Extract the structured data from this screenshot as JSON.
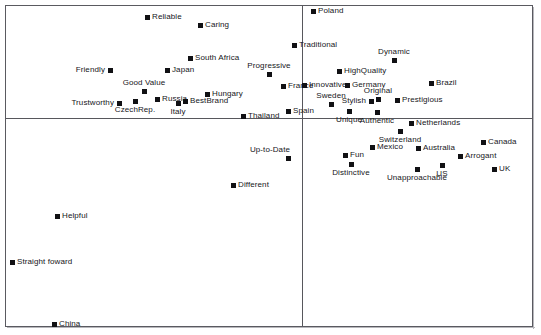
{
  "figure": {
    "type": "perceptual-map",
    "background": "#ffffff",
    "frame_color": "#5a5a60",
    "marker_color": "#111114",
    "label_color": "#16161a",
    "width": 541,
    "height": 335
  },
  "axes": {
    "v_axis_x": 302,
    "h_axis_y": 118,
    "plot_left": 6,
    "plot_top": 6,
    "plot_right": 532,
    "plot_bottom": 326
  },
  "chart_data": {
    "type": "scatter",
    "title": "",
    "subtitle": "",
    "xlabel": "",
    "ylabel": "",
    "xlim": [
      6,
      532
    ],
    "ylim": [
      6,
      326
    ],
    "grid": false,
    "legend": "none",
    "annotations": [
      "vertical axis line at x=302",
      "horizontal axis line at y=118"
    ],
    "points": [
      {
        "label": "Reliable",
        "x": 147,
        "y": 17,
        "lp": "lp-right"
      },
      {
        "label": "Caring",
        "x": 200,
        "y": 25,
        "lp": "lp-right"
      },
      {
        "label": "Poland",
        "x": 313,
        "y": 11,
        "lp": "lp-right"
      },
      {
        "label": "Traditional",
        "x": 294,
        "y": 45,
        "lp": "lp-right"
      },
      {
        "label": "Dynamic",
        "x": 394,
        "y": 60,
        "lp": "lp-above-center"
      },
      {
        "label": "South Africa",
        "x": 190,
        "y": 58,
        "lp": "lp-right"
      },
      {
        "label": "Friendly",
        "x": 110,
        "y": 70,
        "lp": "lp-left"
      },
      {
        "label": "Japan",
        "x": 167,
        "y": 70,
        "lp": "lp-right"
      },
      {
        "label": "Progressive",
        "x": 269,
        "y": 74,
        "lp": "lp-above-center"
      },
      {
        "label": "HighQuality",
        "x": 339,
        "y": 71,
        "lp": "lp-right"
      },
      {
        "label": "Brazil",
        "x": 431,
        "y": 83,
        "lp": "lp-right"
      },
      {
        "label": "Good Value",
        "x": 144,
        "y": 91,
        "lp": "lp-above-center"
      },
      {
        "label": "France",
        "x": 283,
        "y": 86,
        "lp": "lp-right"
      },
      {
        "label": "Innovative",
        "x": 304,
        "y": 85,
        "lp": "lp-right"
      },
      {
        "label": "Germany",
        "x": 347,
        "y": 85,
        "lp": "lp-right"
      },
      {
        "label": "Hungary",
        "x": 207,
        "y": 94,
        "lp": "lp-right"
      },
      {
        "label": "Trustworthy",
        "x": 119,
        "y": 103,
        "lp": "lp-left"
      },
      {
        "label": "CzechRep.",
        "x": 135,
        "y": 101,
        "lp": "lp-below-center"
      },
      {
        "label": "Russia",
        "x": 157,
        "y": 99,
        "lp": "lp-right"
      },
      {
        "label": "Italy",
        "x": 178,
        "y": 103,
        "lp": "lp-below-center"
      },
      {
        "label": "BestBrand",
        "x": 185,
        "y": 101,
        "lp": "lp-right"
      },
      {
        "label": "Sweden",
        "x": 331,
        "y": 104,
        "lp": "lp-above-center"
      },
      {
        "label": "Stylish",
        "x": 371,
        "y": 101,
        "lp": "lp-left"
      },
      {
        "label": "Original",
        "x": 378,
        "y": 99,
        "lp": "lp-above-center"
      },
      {
        "label": "Prestigious",
        "x": 397,
        "y": 100,
        "lp": "lp-right"
      },
      {
        "label": "Thailand",
        "x": 243,
        "y": 116,
        "lp": "lp-right"
      },
      {
        "label": "Spain",
        "x": 288,
        "y": 111,
        "lp": "lp-right"
      },
      {
        "label": "Unique",
        "x": 349,
        "y": 111,
        "lp": "lp-below-center"
      },
      {
        "label": "Authentic",
        "x": 377,
        "y": 112,
        "lp": "lp-below-center"
      },
      {
        "label": "Netherlands",
        "x": 411,
        "y": 123,
        "lp": "lp-right"
      },
      {
        "label": "Switzerland",
        "x": 400,
        "y": 131,
        "lp": "lp-below-center"
      },
      {
        "label": "Up-to-Date",
        "x": 288,
        "y": 158,
        "lp": "lp-above-left"
      },
      {
        "label": "Mexico",
        "x": 372,
        "y": 147,
        "lp": "lp-right"
      },
      {
        "label": "Australia",
        "x": 418,
        "y": 148,
        "lp": "lp-right"
      },
      {
        "label": "Canada",
        "x": 483,
        "y": 142,
        "lp": "lp-right"
      },
      {
        "label": "Fun",
        "x": 345,
        "y": 155,
        "lp": "lp-right"
      },
      {
        "label": "Arrogant",
        "x": 460,
        "y": 156,
        "lp": "lp-right"
      },
      {
        "label": "Distinctive",
        "x": 351,
        "y": 164,
        "lp": "lp-below-center"
      },
      {
        "label": "US",
        "x": 442,
        "y": 165,
        "lp": "lp-below-center"
      },
      {
        "label": "UK",
        "x": 494,
        "y": 169,
        "lp": "lp-right"
      },
      {
        "label": "Unapproachable",
        "x": 417,
        "y": 169,
        "lp": "lp-below-center"
      },
      {
        "label": "Different",
        "x": 233,
        "y": 185,
        "lp": "lp-right"
      },
      {
        "label": "Helpful",
        "x": 57,
        "y": 216,
        "lp": "lp-right"
      },
      {
        "label": "Straight foward",
        "x": 12,
        "y": 262,
        "lp": "lp-right"
      },
      {
        "label": "China",
        "x": 54,
        "y": 324,
        "lp": "lp-right"
      }
    ]
  }
}
